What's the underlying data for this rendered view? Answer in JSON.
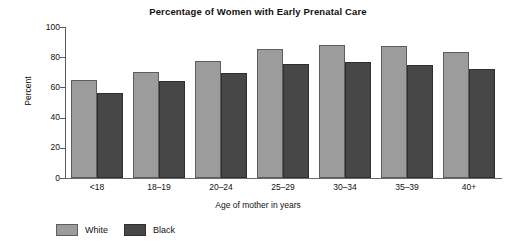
{
  "chart_data": {
    "type": "bar",
    "title": "Percentage of Women with Early Prenatal Care",
    "xlabel": "Age of mother in years",
    "ylabel": "Percent",
    "ylim": [
      0,
      100
    ],
    "yticks": [
      0,
      20,
      40,
      60,
      80,
      100
    ],
    "ytick_labels": [
      "0",
      "20",
      "40",
      "60",
      "80",
      "100"
    ],
    "grid": false,
    "legend_position": "below-left",
    "categories": [
      "<18",
      "18–19",
      "20–24",
      "25–29",
      "30–34",
      "35–39",
      "40+"
    ],
    "series": [
      {
        "name": "White",
        "color": "#9c9c9c",
        "values": [
          65,
          70.5,
          77.5,
          85.5,
          88,
          87.5,
          83.5
        ]
      },
      {
        "name": "Black",
        "color": "#474747",
        "values": [
          56.5,
          64,
          69.5,
          75.5,
          77,
          75,
          72.5
        ]
      }
    ]
  },
  "legend": {
    "entries": [
      {
        "label": "White"
      },
      {
        "label": "Black"
      }
    ]
  }
}
